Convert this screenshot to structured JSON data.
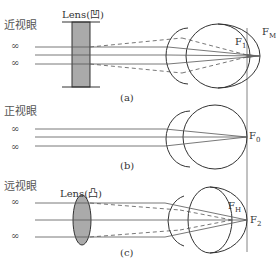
{
  "panels": [
    {
      "id": "a",
      "title": "近视眼",
      "caption": "(a)",
      "infinity_top": "∞",
      "infinity_bottom": "∞",
      "lens_label": "Lens(凹)",
      "lens_type": "concave",
      "focus_labels": [
        {
          "main": "F",
          "sub": "1"
        },
        {
          "main": "F",
          "sub": "M"
        }
      ]
    },
    {
      "id": "b",
      "title": "正视眼",
      "caption": "(b)",
      "infinity_top": "∞",
      "infinity_bottom": "∞",
      "focus_labels": [
        {
          "main": "F",
          "sub": "0"
        }
      ]
    },
    {
      "id": "c",
      "title": "远视眼",
      "caption": "(c)",
      "infinity_top": "∞",
      "infinity_bottom": "∞",
      "lens_label": "Lens(凸)",
      "lens_type": "convex",
      "focus_labels": [
        {
          "main": "F",
          "sub": "H"
        },
        {
          "main": "F",
          "sub": "2"
        }
      ]
    }
  ],
  "colors": {
    "line": "#555555",
    "lens_fill": "#aaaaaa",
    "outline": "#333333"
  }
}
